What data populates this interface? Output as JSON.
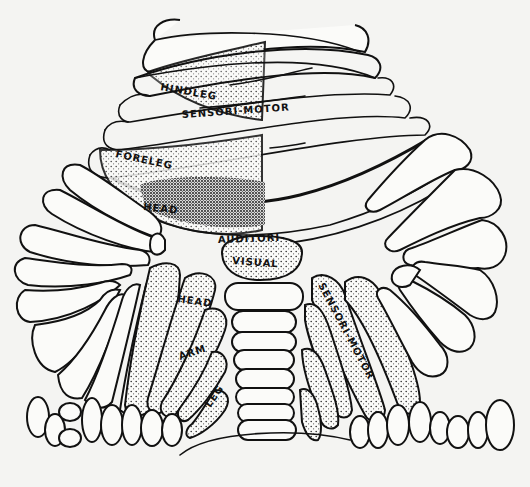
{
  "figure": {
    "labels": {
      "hindleg": "HINDLEG",
      "sensori_motor_top": "SENSORI-MOTOR",
      "foreleg": "FORELEG",
      "head_top": "HEAD",
      "auditori": "AUDITORI-",
      "visual": "VISUAL",
      "head_bottom": "HEAD",
      "arm": "ARM",
      "leg": "LEG",
      "sensori_motor_right": "SENSORI-MOTOR"
    },
    "colors": {
      "ink": "#111111",
      "paper": "#f4f4f2"
    }
  }
}
